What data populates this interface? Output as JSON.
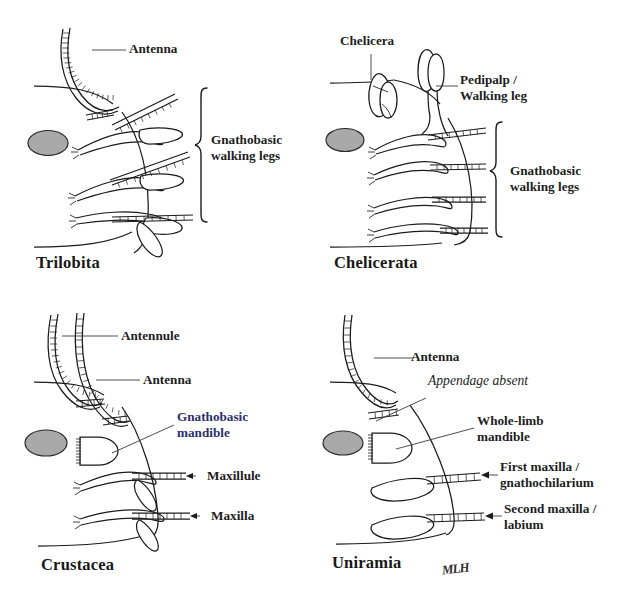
{
  "figure": {
    "background_color": "#ffffff",
    "ink_color": "#1b1b1b",
    "eye_color": "#a9a9a9",
    "accent_color": "#2a2f70",
    "signature": "MLH"
  },
  "panels": [
    {
      "id": "trilobita",
      "taxon": "Trilobita",
      "labels": [
        {
          "text": "Antenna",
          "kind": "plain"
        },
        {
          "text": "Gnathobasic\nwalking legs",
          "line1": "Gnathobasic",
          "line2": "walking legs",
          "kind": "brace"
        }
      ]
    },
    {
      "id": "chelicerata",
      "taxon": "Chelicerata",
      "labels": [
        {
          "text": "Chelicera",
          "kind": "plain"
        },
        {
          "text": "Pedipalp /\nWalking leg",
          "line1": "Pedipalp /",
          "line2": "Walking leg",
          "kind": "plain"
        },
        {
          "text": "Gnathobasic\nwalking legs",
          "line1": "Gnathobasic",
          "line2": "walking legs",
          "kind": "brace"
        }
      ]
    },
    {
      "id": "crustacea",
      "taxon": "Crustacea",
      "labels": [
        {
          "text": "Antennule",
          "kind": "plain"
        },
        {
          "text": "Antenna",
          "kind": "plain"
        },
        {
          "text": "Gnathobasic\nmandible",
          "line1": "Gnathobasic",
          "line2": "mandible",
          "kind": "accent"
        },
        {
          "text": "Maxillule",
          "kind": "arrow"
        },
        {
          "text": "Maxilla",
          "kind": "arrow"
        }
      ]
    },
    {
      "id": "uniramia",
      "taxon": "Uniramia",
      "labels": [
        {
          "text": "Antenna",
          "kind": "plain"
        },
        {
          "text": "Appendage absent",
          "kind": "italic"
        },
        {
          "text": "Whole-limb\nmandible",
          "line1": "Whole-limb",
          "line2": "mandible",
          "kind": "plain"
        },
        {
          "text": "First maxilla /\ngnathochilarium",
          "line1": "First maxilla /",
          "line2": "gnathochilarium",
          "kind": "arrow"
        },
        {
          "text": "Second maxilla /\nlabium",
          "line1": "Second maxilla /",
          "line2": "labium",
          "kind": "arrow"
        }
      ]
    }
  ],
  "trilobita": {
    "taxon": "Trilobita",
    "antenna_label": "Antenna",
    "brace_line1": "Gnathobasic",
    "brace_line2": "walking legs"
  },
  "chelicerata": {
    "taxon": "Chelicerata",
    "chelicera_label": "Chelicera",
    "pedipalp_line1": "Pedipalp /",
    "pedipalp_line2": "Walking leg",
    "brace_line1": "Gnathobasic",
    "brace_line2": "walking legs"
  },
  "crustacea": {
    "taxon": "Crustacea",
    "antennule_label": "Antennule",
    "antenna_label": "Antenna",
    "mandible_line1": "Gnathobasic",
    "mandible_line2": "mandible",
    "maxillule_label": "Maxillule",
    "maxilla_label": "Maxilla"
  },
  "uniramia": {
    "taxon": "Uniramia",
    "antenna_label": "Antenna",
    "absent_label": "Appendage absent",
    "mandible_line1": "Whole-limb",
    "mandible_line2": "mandible",
    "first_maxilla_line1": "First maxilla /",
    "first_maxilla_line2": "gnathochilarium",
    "second_maxilla_line1": "Second maxilla /",
    "second_maxilla_line2": "labium",
    "signature": "MLH"
  }
}
